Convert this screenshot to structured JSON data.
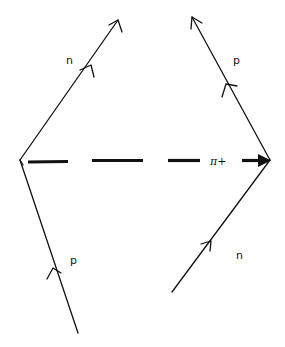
{
  "diagram": {
    "type": "feynman-diagram",
    "colors": {
      "ink": "#111111",
      "background": "#ffffff"
    },
    "left_vertex": {
      "x": 20,
      "y": 160
    },
    "right_vertex": {
      "x": 270,
      "y": 160
    },
    "lines": [
      {
        "id": "left-incoming",
        "particle": "p",
        "label": "p",
        "from": [
          78,
          333
        ],
        "to": [
          20,
          160
        ],
        "arrow": "mid"
      },
      {
        "id": "left-outgoing",
        "particle": "n",
        "label": "n",
        "from": [
          20,
          160
        ],
        "to": [
          118,
          20
        ],
        "arrow": "mid-and-end"
      },
      {
        "id": "right-incoming",
        "particle": "n",
        "label": "n",
        "from": [
          172,
          292
        ],
        "to": [
          270,
          160
        ],
        "arrow": "mid"
      },
      {
        "id": "right-outgoing",
        "particle": "p",
        "label": "p",
        "from": [
          270,
          160
        ],
        "to": [
          192,
          17
        ],
        "arrow": "mid-and-end"
      },
      {
        "id": "exchange",
        "particle": "π+",
        "label": "π+",
        "from": [
          28,
          161
        ],
        "to": [
          270,
          161
        ],
        "style": "dashed",
        "arrow": "end"
      }
    ],
    "labels": {
      "top_left": "n",
      "bottom_left": "p",
      "top_right": "p",
      "bottom_right": "n",
      "exchange": "π+"
    }
  }
}
